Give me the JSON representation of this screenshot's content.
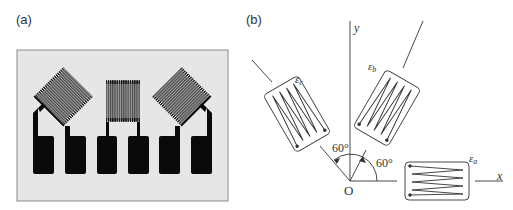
{
  "panels": {
    "a": {
      "label": "(a)",
      "description": "Photograph of a three-element strain gauge rosette foil pattern",
      "background_color": "#e6e6e6",
      "foil_color": "#0a0a0a",
      "grid_color": "#7a7a7a",
      "gauges": [
        {
          "name": "left",
          "orientation_deg": 45
        },
        {
          "name": "center",
          "orientation_deg": 90
        },
        {
          "name": "right",
          "orientation_deg": 135
        }
      ],
      "pad_count": 6
    },
    "b": {
      "label": "(b)",
      "description": "Rosette geometry: three gauges at 0°, 60° and 120° from x-axis",
      "axes": {
        "x_label": "x",
        "y_label": "y",
        "origin_label": "O"
      },
      "gauges": [
        {
          "name": "epsilon_a",
          "label": "ε",
          "subscript": "a",
          "angle_deg": 0
        },
        {
          "name": "epsilon_b",
          "label": "ε",
          "subscript": "b",
          "angle_deg": 60
        },
        {
          "name": "epsilon_c",
          "label": "ε",
          "subscript": "c",
          "angle_deg": 120
        }
      ],
      "angle_annotations": [
        {
          "text": "60°",
          "between": "x-axis and ε_b"
        },
        {
          "text": "60°",
          "between": "ε_b and ε_c"
        }
      ]
    }
  }
}
